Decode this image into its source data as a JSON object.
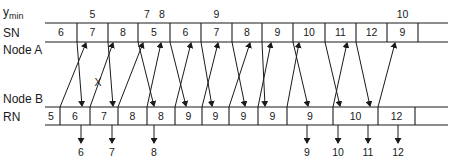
{
  "labels": {
    "ymin": "y",
    "ymin_sub": "min",
    "sn": "SN",
    "node_a": "Node A",
    "node_b": "Node B",
    "rn": "RN"
  },
  "ymin_values": [
    {
      "value": "5",
      "above_sn_index": 1
    },
    {
      "value": "7",
      "above_sn_index": 3,
      "offset": "left"
    },
    {
      "value": "8",
      "above_sn_index": 3,
      "offset": "right"
    },
    {
      "value": "9",
      "above_sn_index": 5
    },
    {
      "value": "10",
      "above_sn_index": 11
    }
  ],
  "sn_cells": [
    "6",
    "7",
    "8",
    "5",
    "6",
    "7",
    "8",
    "9",
    "10",
    "11",
    "12",
    "9",
    ""
  ],
  "rn_cells": [
    "5",
    "6",
    "7",
    "8",
    "8",
    "9",
    "9",
    "9",
    "9",
    "9",
    "10",
    "12",
    ""
  ],
  "outputs": [
    {
      "value": "6",
      "rn_index": 1
    },
    {
      "value": "7",
      "rn_index": 2
    },
    {
      "value": "8",
      "rn_index": 4
    },
    {
      "value": "9",
      "rn_index": 9
    },
    {
      "value": "10",
      "rn_index": 10
    },
    {
      "value": "11",
      "rn_index": 10
    },
    {
      "value": "12",
      "rn_index": 11
    }
  ],
  "crossed_mark": "X"
}
